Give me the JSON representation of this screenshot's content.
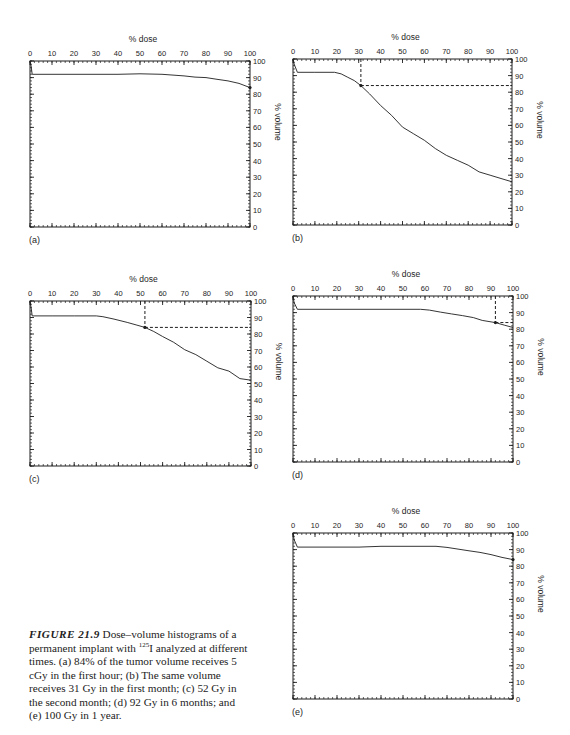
{
  "caption": {
    "label": "FIGURE 21.9",
    "text_before_isotope": " Dose–volume histograms of a permanent implant with ",
    "isotope_mass": "125",
    "isotope_symbol": "I",
    "text_after_isotope": " analyzed at different times. (a) 84% of the tumor volume receives 5 cGy in the first hour; (b) The same volume receives 31 Gy in the first month; (c) 52 Gy in the second month; (d) 92 Gy in 6 months; and (e) 100 Gy in 1 year."
  },
  "chart_data": [
    {
      "type": "line",
      "panel_label": "(a)",
      "title": "",
      "xlabel": "% dose",
      "ylabel": "% volume",
      "xlim": [
        0,
        100
      ],
      "ylim": [
        0,
        100
      ],
      "x_ticks": [
        "0",
        "10",
        "20",
        "30",
        "40",
        "50",
        "60",
        "70",
        "80",
        "90",
        "100"
      ],
      "y_ticks": [
        "0",
        "10",
        "20",
        "30",
        "40",
        "50",
        "60",
        "70",
        "80",
        "90",
        "100"
      ],
      "x": [
        0,
        0.5,
        1,
        10,
        20,
        30,
        40,
        50,
        60,
        65,
        70,
        75,
        80,
        85,
        90,
        95,
        100
      ],
      "y": [
        100,
        97,
        92,
        92,
        92,
        92,
        92,
        92.3,
        92,
        91.5,
        91,
        90.3,
        90,
        89,
        88,
        86.5,
        84
      ],
      "marker": {
        "x": 100,
        "y": 84
      },
      "reference_lines": []
    },
    {
      "type": "line",
      "panel_label": "(b)",
      "title": "",
      "xlabel": "% dose",
      "ylabel": "% volume",
      "xlim": [
        0,
        100
      ],
      "ylim": [
        0,
        100
      ],
      "x_ticks": [
        "0",
        "10",
        "20",
        "30",
        "40",
        "50",
        "60",
        "70",
        "80",
        "90",
        "100"
      ],
      "y_ticks": [
        "0",
        "10",
        "20",
        "30",
        "40",
        "50",
        "60",
        "70",
        "80",
        "90",
        "100"
      ],
      "x": [
        0,
        0.5,
        2,
        10,
        19,
        22,
        25,
        28,
        31,
        35,
        40,
        45,
        50,
        55,
        60,
        65,
        70,
        75,
        80,
        85,
        90,
        95,
        100
      ],
      "y": [
        100,
        97,
        92,
        92,
        92,
        91,
        89,
        87,
        84,
        79,
        72,
        66,
        59,
        55,
        51,
        46,
        42,
        39,
        36,
        32,
        30,
        28,
        26
      ],
      "marker": {
        "x": 31,
        "y": 84
      },
      "reference_lines": [
        {
          "x": 31,
          "y": 84
        }
      ]
    },
    {
      "type": "line",
      "panel_label": "(c)",
      "title": "",
      "xlabel": "% dose",
      "ylabel": "% volume",
      "xlim": [
        0,
        100
      ],
      "ylim": [
        0,
        100
      ],
      "x_ticks": [
        "0",
        "10",
        "20",
        "30",
        "40",
        "50",
        "60",
        "70",
        "80",
        "90",
        "100"
      ],
      "y_ticks": [
        "0",
        "10",
        "20",
        "30",
        "40",
        "50",
        "60",
        "70",
        "80",
        "90",
        "100"
      ],
      "x": [
        0,
        0.5,
        1,
        10,
        20,
        30,
        33,
        38,
        44,
        48,
        52,
        56,
        60,
        65,
        70,
        75,
        80,
        85,
        90,
        95,
        100
      ],
      "y": [
        100,
        96,
        91,
        91,
        91,
        91,
        90.5,
        89,
        87,
        85.5,
        84,
        81.5,
        78.5,
        75,
        70.5,
        67.5,
        63.5,
        59.5,
        57.5,
        53,
        52
      ],
      "marker": {
        "x": 52,
        "y": 84
      },
      "reference_lines": [
        {
          "x": 52,
          "y": 84
        }
      ]
    },
    {
      "type": "line",
      "panel_label": "(d)",
      "title": "",
      "xlabel": "% dose",
      "ylabel": "% volume",
      "xlim": [
        0,
        100
      ],
      "ylim": [
        0,
        100
      ],
      "x_ticks": [
        "0",
        "10",
        "20",
        "30",
        "40",
        "50",
        "60",
        "70",
        "80",
        "90",
        "100"
      ],
      "y_ticks": [
        "0",
        "10",
        "20",
        "30",
        "40",
        "50",
        "60",
        "70",
        "80",
        "90",
        "100"
      ],
      "x": [
        0,
        0.5,
        2,
        10,
        20,
        30,
        40,
        50,
        58,
        62,
        67,
        72,
        77,
        82,
        86,
        92,
        96,
        100
      ],
      "y": [
        100,
        96,
        92,
        92,
        92,
        92,
        92,
        92,
        92,
        91.5,
        90.3,
        89.2,
        88.2,
        87,
        85.3,
        84,
        82.5,
        81
      ],
      "marker": {
        "x": 92,
        "y": 84
      },
      "reference_lines": [
        {
          "x": 92,
          "y": 84
        }
      ]
    },
    {
      "type": "line",
      "panel_label": "(e)",
      "title": "",
      "xlabel": "% dose",
      "ylabel": "% volume",
      "xlim": [
        0,
        100
      ],
      "ylim": [
        0,
        100
      ],
      "x_ticks": [
        "0",
        "10",
        "20",
        "30",
        "40",
        "50",
        "60",
        "70",
        "80",
        "90",
        "100"
      ],
      "y_ticks": [
        "0",
        "10",
        "20",
        "30",
        "40",
        "50",
        "60",
        "70",
        "80",
        "90",
        "100"
      ],
      "x": [
        0,
        0.5,
        2,
        10,
        20,
        30,
        40,
        50,
        60,
        65,
        70,
        75,
        80,
        85,
        90,
        95,
        100
      ],
      "y": [
        100,
        96,
        91.5,
        91.5,
        91.5,
        91.5,
        92,
        92,
        92,
        92,
        91.3,
        90.3,
        89.3,
        88.3,
        87,
        85.3,
        84
      ],
      "marker": {
        "x": 100,
        "y": 84
      },
      "reference_lines": []
    }
  ]
}
